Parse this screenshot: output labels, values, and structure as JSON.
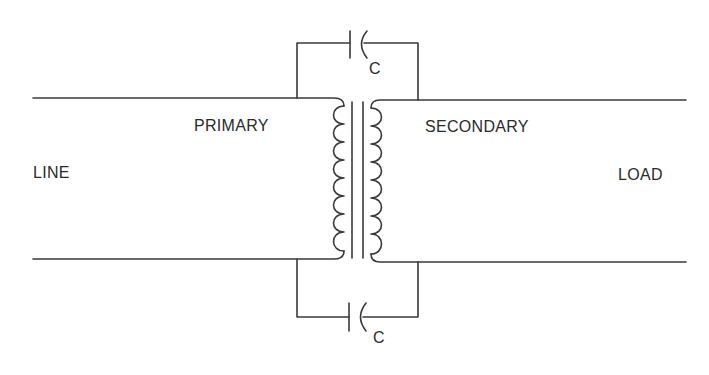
{
  "diagram": {
    "type": "transformer schematic with bypass capacitors",
    "labels": {
      "line": "LINE",
      "load": "LOAD",
      "primary": "PRIMARY",
      "secondary": "SECONDARY",
      "cap_top": "C",
      "cap_bottom": "C"
    },
    "colors": {
      "stroke": "#3a3a3a",
      "text": "#2a2a2a",
      "background": "#ffffff"
    }
  }
}
